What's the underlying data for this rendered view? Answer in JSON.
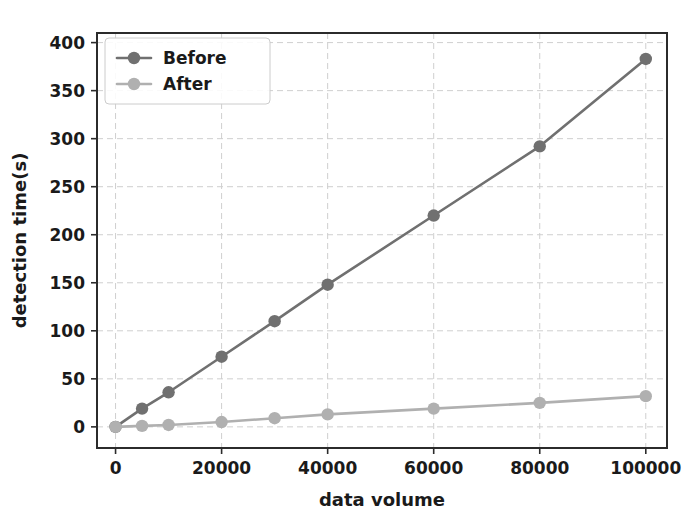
{
  "chart_data": {
    "type": "line",
    "title": "",
    "xlabel": "data volume",
    "ylabel": "detection time(s)",
    "xlim": [
      -3500,
      104000
    ],
    "ylim": [
      -22,
      410
    ],
    "xticks": [
      0,
      20000,
      40000,
      60000,
      80000,
      100000
    ],
    "xtick_labels": [
      "0",
      "20000",
      "40000",
      "60000",
      "80000",
      "100000"
    ],
    "yticks": [
      0,
      50,
      100,
      150,
      200,
      250,
      300,
      350,
      400
    ],
    "ytick_labels": [
      "0",
      "50",
      "100",
      "150",
      "200",
      "250",
      "300",
      "350",
      "400"
    ],
    "grid": true,
    "grid_style": "dashed",
    "legend_position": "upper left",
    "x": [
      0,
      5000,
      10000,
      20000,
      30000,
      40000,
      60000,
      80000,
      100000
    ],
    "series": [
      {
        "name": "Before",
        "color": "#707070",
        "marker": "o",
        "values": [
          0,
          19,
          36,
          73,
          110,
          148,
          220,
          292,
          383
        ]
      },
      {
        "name": "After",
        "color": "#b0b0b0",
        "marker": "o",
        "values": [
          0,
          1,
          2,
          5,
          9,
          13,
          19,
          25,
          32
        ]
      }
    ]
  },
  "legend": {
    "entries": [
      {
        "label": "Before"
      },
      {
        "label": "After"
      }
    ]
  },
  "colors": {
    "before": "#707070",
    "after": "#b0b0b0",
    "axis": "#2b2b2b",
    "grid": "#cfcfcf",
    "text": "#1a1a1a",
    "background": "#ffffff"
  }
}
